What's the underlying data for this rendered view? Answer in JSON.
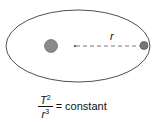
{
  "diagram": {
    "radius_label": "r",
    "formula": {
      "numerator_var": "T",
      "numerator_exp": "2",
      "denominator_var": "r",
      "denominator_exp": "3",
      "rhs": "= constant"
    },
    "colors": {
      "sun": "#8a8a8a",
      "planet": "#777777",
      "orbit": "#222222"
    }
  }
}
